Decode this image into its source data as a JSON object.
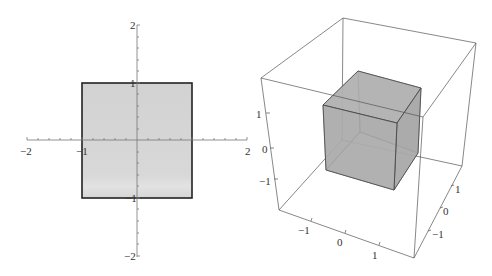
{
  "plot2d": {
    "name": "2D square plot",
    "axis_range": [
      -2,
      2
    ],
    "square_range": [
      -1,
      1
    ],
    "x_ticks": [
      {
        "value": -2,
        "label": "−2"
      },
      {
        "value": -1,
        "label": "−1"
      },
      {
        "value": 2,
        "label": "2"
      }
    ],
    "y_ticks": [
      {
        "value": 2,
        "label": "2"
      },
      {
        "value": 1,
        "label": "1"
      },
      {
        "value": -1,
        "label": "−1"
      },
      {
        "value": -2,
        "label": "−2"
      }
    ],
    "fill_color": "#d6d6d6",
    "edge_color": "#222222"
  },
  "plot3d": {
    "name": "3D cube plot",
    "axis_range": [
      -2,
      2
    ],
    "cube_range": [
      -1,
      1
    ],
    "x_ticks": [
      {
        "label": "−1"
      },
      {
        "label": "0"
      },
      {
        "label": "1"
      }
    ],
    "y_ticks": [
      {
        "label": "1"
      },
      {
        "label": "0"
      },
      {
        "label": "−1"
      }
    ],
    "z_ticks": [
      {
        "label": "1"
      },
      {
        "label": "0"
      },
      {
        "label": "−1"
      }
    ],
    "cube_color": "#a8a8a8",
    "box_color": "#555555"
  }
}
